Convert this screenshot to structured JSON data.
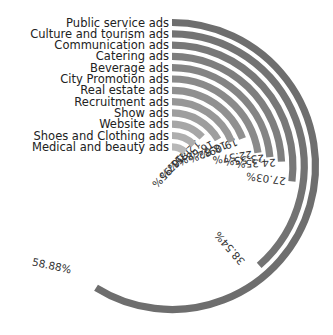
{
  "chart_data": {
    "type": "radial-bar",
    "title": "",
    "start_angle_deg": 0,
    "full_scale_percent": 100,
    "categories": [
      "Public service ads",
      "Culture and tourism ads",
      "Communication ads",
      "Catering ads",
      "Beverage ads",
      "City Promotion ads",
      "Real estate ads",
      "Recruitment ads",
      "Show ads",
      "Website ads",
      "Shoes and Clothing ads",
      "Medical and beauty ads"
    ],
    "values": [
      58.88,
      38.54,
      27.03,
      24.35,
      23.55,
      22.57,
      19.09,
      18.82,
      16.68,
      12.85,
      12.67,
      11.95
    ],
    "value_labels": [
      "58.88%",
      "38.54%",
      "27.03%",
      "24.35%",
      "23.55%",
      "22.57%",
      "19.09%",
      "18.82%",
      "16.68%",
      "12.85%",
      "12.67%",
      "11.95%"
    ],
    "colors": [
      "#6e6e6e",
      "#737373",
      "#787878",
      "#7e7e7e",
      "#848484",
      "#8a8a8a",
      "#909090",
      "#979797",
      "#9e9e9e",
      "#a6a6a6",
      "#aeaeae",
      "#b8b8b8"
    ],
    "legend": "category labels left of ring starts"
  }
}
